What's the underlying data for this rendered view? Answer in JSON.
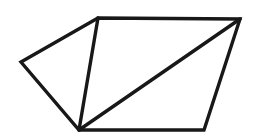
{
  "figure": {
    "background_color": "#ffffff",
    "stroke_color": "#181818",
    "stroke_width": 3.4,
    "canvas": {
      "width": 254,
      "height": 138
    },
    "shape_type": "polygon",
    "vertex_count": 5,
    "region_count": 3,
    "vertices": [
      {
        "name": "left",
        "label": "A",
        "x": 21,
        "y": 62
      },
      {
        "name": "top-left",
        "label": "B",
        "x": 98,
        "y": 18
      },
      {
        "name": "top-right",
        "label": "C",
        "x": 240,
        "y": 19
      },
      {
        "name": "bottom-right",
        "label": "D",
        "x": 204,
        "y": 130
      },
      {
        "name": "bottom",
        "label": "E",
        "x": 79,
        "y": 130
      }
    ],
    "outline_path": "M 21 62 L 98 18 L 240 19 L 204 130 L 79 130 Z",
    "edges": [
      {
        "name": "edge-left-topleft",
        "from": "A",
        "to": "B",
        "x1": 21,
        "y1": 62,
        "x2": 98,
        "y2": 18
      },
      {
        "name": "edge-topleft-topright",
        "from": "B",
        "to": "C",
        "x1": 98,
        "y1": 18,
        "x2": 240,
        "y2": 19
      },
      {
        "name": "edge-topright-bottomright",
        "from": "C",
        "to": "D",
        "x1": 240,
        "y1": 19,
        "x2": 204,
        "y2": 130
      },
      {
        "name": "edge-bottomright-bottom",
        "from": "D",
        "to": "E",
        "x1": 204,
        "y1": 130,
        "x2": 79,
        "y2": 130
      },
      {
        "name": "edge-bottom-left",
        "from": "E",
        "to": "A",
        "x1": 79,
        "y1": 130,
        "x2": 21,
        "y2": 62
      }
    ],
    "diagonals": [
      {
        "name": "diagonal-topleft-bottom",
        "from": "B",
        "to": "E",
        "x1": 98,
        "y1": 18,
        "x2": 79,
        "y2": 130
      },
      {
        "name": "diagonal-topright-bottom",
        "from": "C",
        "to": "E",
        "x1": 240,
        "y1": 19,
        "x2": 79,
        "y2": 130
      }
    ],
    "regions": [
      {
        "name": "region-left-triangle",
        "vertices": [
          "A",
          "B",
          "E"
        ]
      },
      {
        "name": "region-middle-triangle",
        "vertices": [
          "B",
          "C",
          "E"
        ]
      },
      {
        "name": "region-right-triangle",
        "vertices": [
          "C",
          "D",
          "E"
        ]
      }
    ]
  }
}
